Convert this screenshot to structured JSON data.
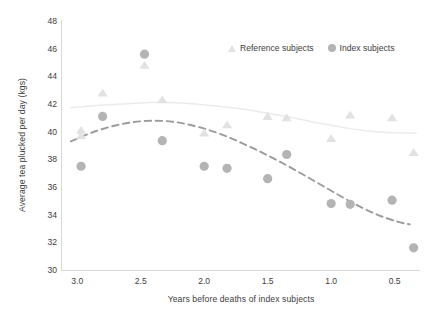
{
  "chart_data": {
    "type": "scatter",
    "title": "",
    "xlabel": "Years before deaths of index subjects",
    "ylabel": "Average tea plucked per day (kgs)",
    "xlim": [
      3.12,
      0.3
    ],
    "ylim": [
      30,
      48
    ],
    "x_reversed": true,
    "xticks": [
      "3.0",
      "2.5",
      "2.0",
      "1.5",
      "1.0",
      "0.5"
    ],
    "xtick_values": [
      3.0,
      2.5,
      2.0,
      1.5,
      1.0,
      0.5
    ],
    "yticks": [
      "30",
      "32",
      "34",
      "36",
      "38",
      "40",
      "42",
      "44",
      "46",
      "48"
    ],
    "ytick_values": [
      30,
      32,
      34,
      36,
      38,
      40,
      42,
      44,
      46,
      48
    ],
    "grid": false,
    "legend_position": "top-right",
    "colors": {
      "reference_marker": "#e2e2e2",
      "index_marker": "#b4b4b4",
      "reference_line": "#ebebeb",
      "index_line": "#9b9b9b",
      "axis": "#d8d8d8",
      "text": "#3d3d3d"
    },
    "series": [
      {
        "name": "Reference subjects",
        "marker": "triangle",
        "color": "#e2e2e2",
        "points": [
          {
            "x": 2.97,
            "y": 40.1
          },
          {
            "x": 2.97,
            "y": 39.7
          },
          {
            "x": 2.8,
            "y": 42.8
          },
          {
            "x": 2.47,
            "y": 44.8
          },
          {
            "x": 2.33,
            "y": 42.3
          },
          {
            "x": 2.0,
            "y": 39.9
          },
          {
            "x": 1.82,
            "y": 40.5
          },
          {
            "x": 1.5,
            "y": 41.1
          },
          {
            "x": 1.35,
            "y": 41.0
          },
          {
            "x": 1.0,
            "y": 39.5
          },
          {
            "x": 0.85,
            "y": 41.2
          },
          {
            "x": 0.52,
            "y": 41.0
          },
          {
            "x": 0.35,
            "y": 38.5
          }
        ]
      },
      {
        "name": "Index subjects",
        "marker": "circle",
        "color": "#b4b4b4",
        "points": [
          {
            "x": 2.97,
            "y": 37.5
          },
          {
            "x": 2.8,
            "y": 41.1
          },
          {
            "x": 2.47,
            "y": 45.6
          },
          {
            "x": 2.33,
            "y": 39.35
          },
          {
            "x": 2.0,
            "y": 37.5
          },
          {
            "x": 1.82,
            "y": 37.35
          },
          {
            "x": 1.5,
            "y": 36.6
          },
          {
            "x": 1.35,
            "y": 38.35
          },
          {
            "x": 1.0,
            "y": 34.8
          },
          {
            "x": 0.85,
            "y": 34.75
          },
          {
            "x": 0.52,
            "y": 35.05
          },
          {
            "x": 0.35,
            "y": 31.6
          }
        ]
      }
    ],
    "trend_lines": [
      {
        "name": "Reference subjects trend",
        "style": "solid",
        "color": "#ebebeb",
        "points": [
          {
            "x": 3.05,
            "y": 41.75
          },
          {
            "x": 2.8,
            "y": 41.92
          },
          {
            "x": 2.55,
            "y": 42.05
          },
          {
            "x": 2.35,
            "y": 42.12
          },
          {
            "x": 2.1,
            "y": 42.02
          },
          {
            "x": 1.85,
            "y": 41.8
          },
          {
            "x": 1.6,
            "y": 41.5
          },
          {
            "x": 1.35,
            "y": 41.1
          },
          {
            "x": 1.1,
            "y": 40.62
          },
          {
            "x": 0.85,
            "y": 40.22
          },
          {
            "x": 0.62,
            "y": 39.98
          },
          {
            "x": 0.42,
            "y": 39.9
          },
          {
            "x": 0.33,
            "y": 39.9
          }
        ]
      },
      {
        "name": "Index subjects trend",
        "style": "dashed",
        "color": "#9b9b9b",
        "points": [
          {
            "x": 3.05,
            "y": 39.3
          },
          {
            "x": 2.85,
            "y": 40.05
          },
          {
            "x": 2.65,
            "y": 40.55
          },
          {
            "x": 2.45,
            "y": 40.78
          },
          {
            "x": 2.25,
            "y": 40.72
          },
          {
            "x": 2.05,
            "y": 40.35
          },
          {
            "x": 1.85,
            "y": 39.75
          },
          {
            "x": 1.65,
            "y": 38.95
          },
          {
            "x": 1.45,
            "y": 38.05
          },
          {
            "x": 1.25,
            "y": 37.05
          },
          {
            "x": 1.05,
            "y": 36.0
          },
          {
            "x": 0.85,
            "y": 34.95
          },
          {
            "x": 0.65,
            "y": 34.05
          },
          {
            "x": 0.48,
            "y": 33.5
          },
          {
            "x": 0.38,
            "y": 33.3
          }
        ]
      }
    ]
  },
  "legend": {
    "items": [
      {
        "label": "Reference subjects",
        "marker": "triangle"
      },
      {
        "label": "Index subjects",
        "marker": "circle"
      }
    ]
  }
}
